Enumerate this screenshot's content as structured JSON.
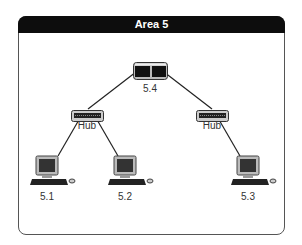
{
  "diagram": {
    "title": "Area 5",
    "nodes": [
      {
        "id": "router",
        "type": "switch",
        "label": "5.4"
      },
      {
        "id": "hub_left",
        "type": "hub",
        "label": "Hub"
      },
      {
        "id": "hub_right",
        "type": "hub",
        "label": "Hub"
      },
      {
        "id": "pc1",
        "type": "computer",
        "label": "5.1"
      },
      {
        "id": "pc2",
        "type": "computer",
        "label": "5.2"
      },
      {
        "id": "pc3",
        "type": "computer",
        "label": "5.3"
      }
    ],
    "edges": [
      [
        "router",
        "hub_left"
      ],
      [
        "router",
        "hub_right"
      ],
      [
        "hub_left",
        "pc1"
      ],
      [
        "hub_left",
        "pc2"
      ],
      [
        "hub_right",
        "pc3"
      ]
    ],
    "colors": {
      "header_bg": "#0d0d0d",
      "header_text": "#ffffff",
      "border": "#555555"
    }
  }
}
